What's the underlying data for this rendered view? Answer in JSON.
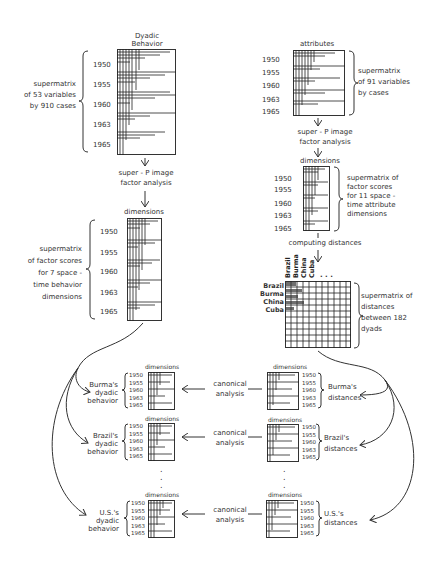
{
  "years": [
    "1950",
    "1955",
    "1960",
    "1963",
    "1965"
  ],
  "left_column": {
    "top_matrix": {
      "header": [
        "Dyadic",
        "Behavior"
      ],
      "description": [
        "supermatrix",
        "of 53 variables",
        "by 910 cases"
      ]
    },
    "step1": [
      "super - P image",
      "factor analysis"
    ],
    "factor_matrix": {
      "header": "dimensions",
      "description": [
        "supermatrix",
        "of factor scores",
        "for 7 space -",
        "time behavior",
        "dimensions"
      ]
    }
  },
  "right_column": {
    "top_matrix": {
      "header": "attributes",
      "description": [
        "supermatrix",
        "of 91 variables",
        "by cases"
      ]
    },
    "step1": [
      "super - P image",
      "factor analysis"
    ],
    "factor_matrix": {
      "header": "dimensions",
      "description": [
        "supermatrix of",
        "factor scores",
        "for 11 space -",
        "time attribute",
        "dimensions"
      ]
    },
    "step2": "computing distances",
    "distance_matrix": {
      "column_headers": [
        "Brazil",
        "Burma",
        "China",
        "Cuba"
      ],
      "row_headers": [
        "Brazil",
        "Burma",
        "China",
        "Cuba"
      ],
      "ellipsis": ". . .",
      "description": [
        "supermatrix of",
        "distances",
        "between 182",
        "dyads"
      ]
    }
  },
  "canonical_rows": [
    {
      "left_label": [
        "Burma's",
        "dyadic",
        "behavior"
      ],
      "right_label": [
        "Burma's",
        "distances"
      ],
      "method": [
        "canonical",
        "analysis"
      ],
      "header": "dimensions"
    },
    {
      "left_label": [
        "Brazil's",
        "dyadic",
        "behavior"
      ],
      "right_label": [
        "Brazil's",
        "distances"
      ],
      "method": [
        "canonical",
        "analysis"
      ],
      "header": "dimensions"
    },
    {
      "left_label": [
        "U.S.'s",
        "dyadic",
        "behavior"
      ],
      "right_label": [
        "U.S.'s",
        "distances"
      ],
      "method": [
        "canonical",
        "analysis"
      ],
      "header": "dimensions"
    }
  ],
  "vertical_ellipsis": "."
}
